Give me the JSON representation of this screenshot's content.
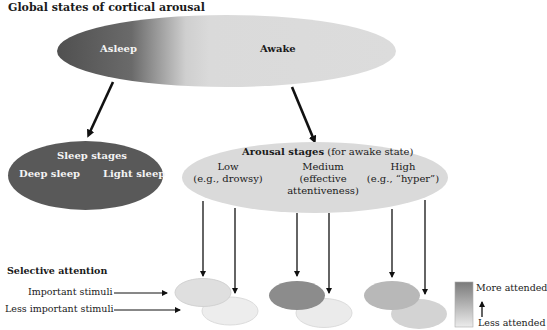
{
  "title": "Global states of cortical arousal",
  "global_states": {
    "asleep": "Asleep",
    "awake": "Awake"
  },
  "sleep_stages": {
    "title": "Sleep stages",
    "deep": "Deep sleep",
    "light": "Light sleep"
  },
  "arousal_stages": {
    "title_bold": "Arousal stages",
    "title_rest": "(for awake state)",
    "levels": [
      {
        "name": "Low",
        "detail": "(e.g., drowsy)"
      },
      {
        "name": "Medium",
        "detail": "(effective",
        "detail2": "attentiveness)"
      },
      {
        "name": "High",
        "detail": "(e.g., “hyper”)"
      }
    ]
  },
  "selective_attention": {
    "title": "Selective attention",
    "important": "Important stimuli",
    "less_important": "Less important stimuli"
  },
  "legend": {
    "more": "More attended",
    "less": "Less attended"
  },
  "colors": {
    "dark": "#575757",
    "light": "#dcdcdc",
    "low_front": "#dedede",
    "low_back": "#ececec",
    "medium_front": "#8c8c8c",
    "medium_back": "#e8e8e8",
    "high_front": "#b8b8b8",
    "high_back": "#d2d2d2"
  }
}
